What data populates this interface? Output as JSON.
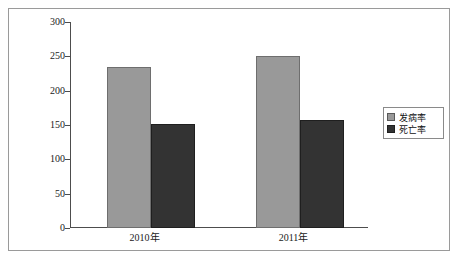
{
  "chart_data": {
    "type": "bar",
    "title": "",
    "subtitle": "",
    "xlabel": "",
    "ylabel": "",
    "categories": [
      "2010年",
      "2011年"
    ],
    "series": [
      {
        "name": "发病率",
        "values": [
          234,
          250
        ],
        "color": "#999999"
      },
      {
        "name": "死亡率",
        "values": [
          152,
          157
        ],
        "color": "#333333"
      }
    ],
    "ylim": [
      0,
      300
    ],
    "yticks": [
      0,
      50,
      100,
      150,
      200,
      250,
      300
    ],
    "ytick_labels": [
      "0",
      "50",
      "100",
      "150",
      "200",
      "250",
      "300"
    ],
    "grid": false,
    "legend_position": "right"
  },
  "axis": {
    "y_tick_labels": [
      "300",
      "250",
      "200",
      "150",
      "100",
      "50",
      "0"
    ],
    "x_tick_labels": [
      "2010年",
      "2011年"
    ]
  },
  "legend": {
    "items": [
      {
        "label": "发病率",
        "swatch": "legend-swatch-incidence"
      },
      {
        "label": "死亡率",
        "swatch": "legend-swatch-mortality"
      }
    ]
  },
  "colors": {
    "series_incidence": "#999999",
    "series_mortality": "#333333",
    "axis": "#4d4d4d",
    "frame": "#9a9a9a",
    "background": "#ffffff"
  }
}
